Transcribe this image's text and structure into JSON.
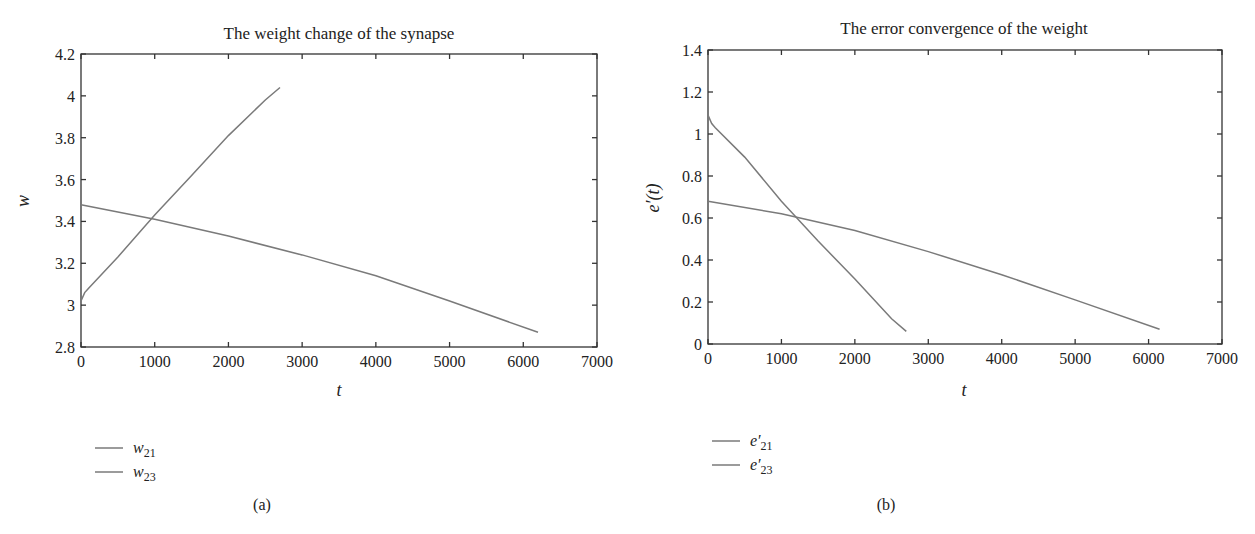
{
  "chart_data": [
    {
      "type": "line",
      "panel": "a",
      "caption": "(a)",
      "title": "The weight change of the synapse",
      "xlabel": "t",
      "ylabel": "w",
      "xlim": [
        0,
        7000
      ],
      "ylim": [
        2.8,
        4.2
      ],
      "xticks": [
        0,
        1000,
        2000,
        3000,
        4000,
        5000,
        6000,
        7000
      ],
      "yticks": [
        2.8,
        3.0,
        3.2,
        3.4,
        3.6,
        3.8,
        4.0,
        4.2
      ],
      "ytick_labels": [
        "2.8",
        "3",
        "3.2",
        "3.4",
        "3.6",
        "3.8",
        "4",
        "4.2"
      ],
      "grid": false,
      "legend_position": "below-left",
      "series": [
        {
          "name": "w21",
          "legend_main": "w",
          "legend_sub": "21",
          "color": "#7a7a7a",
          "x": [
            0,
            50,
            100,
            500,
            1000,
            1500,
            2000,
            2500,
            2700
          ],
          "y": [
            3.02,
            3.06,
            3.08,
            3.23,
            3.43,
            3.62,
            3.81,
            3.98,
            4.04
          ]
        },
        {
          "name": "w23",
          "legend_main": "w",
          "legend_sub": "23",
          "color": "#7a7a7a",
          "x": [
            0,
            1000,
            2000,
            3000,
            4000,
            5000,
            6200
          ],
          "y": [
            3.48,
            3.41,
            3.33,
            3.24,
            3.14,
            3.02,
            2.87
          ]
        }
      ]
    },
    {
      "type": "line",
      "panel": "b",
      "caption": "(b)",
      "title": "The error convergence of the weight",
      "xlabel": "t",
      "ylabel": "e′(t)",
      "xlim": [
        0,
        7000
      ],
      "ylim": [
        0,
        1.4
      ],
      "xticks": [
        0,
        1000,
        2000,
        3000,
        4000,
        5000,
        6000,
        7000
      ],
      "yticks": [
        0,
        0.2,
        0.4,
        0.6,
        0.8,
        1.0,
        1.2,
        1.4
      ],
      "ytick_labels": [
        "0",
        "0.2",
        "0.4",
        "0.6",
        "0.8",
        "1",
        "1.2",
        "1.4"
      ],
      "grid": false,
      "legend_position": "below-left",
      "series": [
        {
          "name": "e'21",
          "legend_main": "e′",
          "legend_sub": "21",
          "color": "#7a7a7a",
          "x": [
            0,
            50,
            100,
            500,
            1000,
            1500,
            2000,
            2500,
            2700
          ],
          "y": [
            1.09,
            1.05,
            1.03,
            0.89,
            0.68,
            0.49,
            0.31,
            0.12,
            0.06
          ]
        },
        {
          "name": "e'23",
          "legend_main": "e′",
          "legend_sub": "23",
          "color": "#7a7a7a",
          "x": [
            0,
            1000,
            2000,
            3000,
            4000,
            5000,
            6150
          ],
          "y": [
            0.68,
            0.62,
            0.54,
            0.44,
            0.33,
            0.21,
            0.07
          ]
        }
      ]
    }
  ]
}
